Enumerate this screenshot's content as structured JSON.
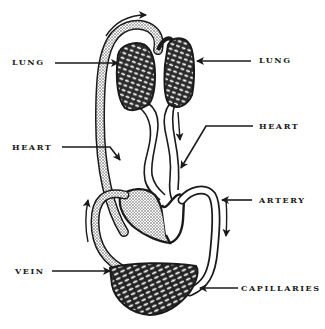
{
  "diagram": {
    "colors": {
      "ink": "#1a1a1a",
      "paper": "#ffffff",
      "stipple": "#555555"
    },
    "labels": {
      "lung_left": "LUNG",
      "lung_right": "LUNG",
      "heart_left": "HEART",
      "heart_right": "HEART",
      "artery": "ARTERY",
      "vein": "VEIN",
      "capillaries": "CAPILLARIES"
    },
    "flow_arrows": [
      "top-over-lungs-right",
      "right-lung-down-to-heart",
      "left-vein-up",
      "right-artery-down"
    ]
  }
}
